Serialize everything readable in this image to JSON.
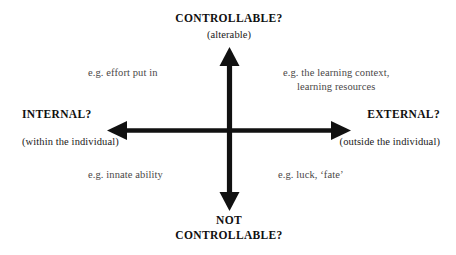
{
  "diagram": {
    "background_color": "#ffffff",
    "axis_color": "#111111",
    "text_color": "#100f0f",
    "note_color": "#4a4747",
    "axes": {
      "vertical": {
        "top_label": "CONTROLLABLE?",
        "top_sublabel": "(alterable)",
        "bottom_label_line1": "NOT",
        "bottom_label_line2": "CONTROLLABLE?"
      },
      "horizontal": {
        "left_label": "INTERNAL?",
        "left_sublabel": "(within the individual)",
        "right_label": "EXTERNAL?",
        "right_sublabel": "(outside the individual)"
      }
    },
    "quadrants": {
      "top_left": {
        "text": "e.g. effort put in"
      },
      "top_right": {
        "line1": "e.g. the learning context,",
        "line2": "learning resources"
      },
      "bottom_left": {
        "text": "e.g. innate ability"
      },
      "bottom_right": {
        "text": "e.g. luck, ‘fate’"
      }
    }
  }
}
